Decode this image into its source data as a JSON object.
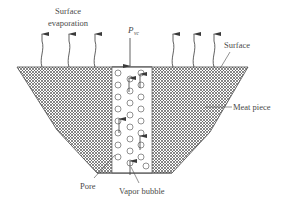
{
  "diagram": {
    "labels": {
      "surface_evaporation_line1": "Surface",
      "surface_evaporation_line2": "evaporation",
      "pressure_symbol": "P",
      "pressure_subscript": "vc",
      "surface": "Surface",
      "meat_piece": "Meat piece",
      "pore": "Pore",
      "vapor_bubble": "Vapor bubble"
    },
    "colors": {
      "line": "#4a4a4a",
      "hatch": "#6a6a6a",
      "background": "#ffffff"
    },
    "evaporation_arrows_left_x": [
      42,
      69,
      95
    ],
    "evaporation_arrows_right_x": [
      173,
      194,
      214
    ]
  }
}
